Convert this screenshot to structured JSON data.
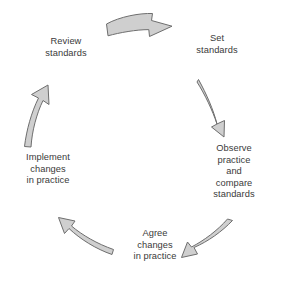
{
  "diagram": {
    "type": "cycle",
    "background_color": "#ffffff",
    "arrow_fill": "#cfcfcf",
    "arrow_stroke": "#6e6e6e",
    "text_color": "#3a3a3a",
    "stage_count": 5,
    "direction": "clockwise",
    "stages": [
      {
        "id": "set-standards",
        "label": "Set\nstandards",
        "position": "top-right",
        "order": 1
      },
      {
        "id": "observe-practice",
        "label": "Observe\npractice\nand\ncompare\nstandards",
        "position": "right",
        "order": 2
      },
      {
        "id": "agree-changes",
        "label": "Agree\nchanges\nin practice",
        "position": "bottom",
        "order": 3
      },
      {
        "id": "implement-changes",
        "label": "Implement\nchanges\nin practice",
        "position": "left",
        "order": 4
      },
      {
        "id": "review-standards",
        "label": "Review\nstandards",
        "position": "top-left",
        "order": 5
      }
    ],
    "arrows": [
      {
        "id": "arrow-review-to-set",
        "from": "review-standards",
        "to": "set-standards",
        "icon": "curved-arrow-right-icon"
      },
      {
        "id": "arrow-set-to-observe",
        "from": "set-standards",
        "to": "observe-practice",
        "icon": "curved-arrow-down-icon"
      },
      {
        "id": "arrow-observe-to-agree",
        "from": "observe-practice",
        "to": "agree-changes",
        "icon": "curved-arrow-down-left-icon"
      },
      {
        "id": "arrow-agree-to-implement",
        "from": "agree-changes",
        "to": "implement-changes",
        "icon": "curved-arrow-up-left-icon"
      },
      {
        "id": "arrow-implement-to-review",
        "from": "implement-changes",
        "to": "review-standards",
        "icon": "curved-arrow-up-icon"
      }
    ]
  }
}
